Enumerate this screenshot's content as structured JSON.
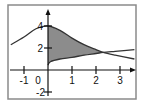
{
  "chart_data": {
    "type": "area",
    "title": "",
    "xlabel": "",
    "ylabel": "",
    "xlim": [
      -1.6,
      3.6
    ],
    "ylim": [
      -2.2,
      5.5
    ],
    "grid": false,
    "x_ticks": [
      -1,
      0,
      1,
      2,
      3
    ],
    "x_tick_labels": [
      "-1",
      "0",
      "1",
      "2",
      "3"
    ],
    "y_ticks": [
      4,
      2,
      -2
    ],
    "y_tick_labels": [
      "4",
      "2",
      "-2"
    ],
    "series": [
      {
        "name": "upper curve (bell-shaped, max at x=0)",
        "x": [
          -1.55,
          -1.0,
          -0.5,
          0,
          0.5,
          1.0,
          1.5,
          2.0,
          2.3,
          2.8,
          3.6
        ],
        "y": [
          2.3,
          3.0,
          3.75,
          4.0,
          3.6,
          2.9,
          2.3,
          1.85,
          1.6,
          1.35,
          1.0
        ]
      },
      {
        "name": "lower curve (increasing, starts at x=0)",
        "x": [
          0,
          0.1,
          0.5,
          1.0,
          1.5,
          2.0,
          2.3,
          2.8,
          3.6
        ],
        "y": [
          0.45,
          0.75,
          1.0,
          1.15,
          1.35,
          1.5,
          1.6,
          1.7,
          1.85
        ]
      }
    ],
    "shaded_region": {
      "description": "area between upper and lower curves from x=0 to intersection",
      "x_from": 0,
      "x_to": 2.3,
      "fill": "#8c8c8c"
    },
    "intersection": {
      "x": 2.3,
      "y": 1.6
    }
  },
  "labels": {
    "x": [
      "-1",
      "0",
      "1",
      "2",
      "3"
    ],
    "y4": "4",
    "y2": "2",
    "yneg2": "-2"
  }
}
